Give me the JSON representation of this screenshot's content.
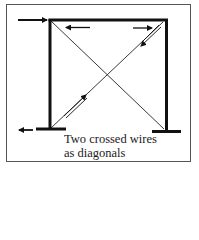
{
  "figure": {
    "caption_line1": "Two crossed wires",
    "caption_line2": "as diagonals",
    "colors": {
      "background": "#ffffff",
      "ink": "#111111",
      "border": "#555555"
    },
    "elements": {
      "frame": "portal frame with two columns and a top beam",
      "bracing": "two crossed diagonal wires",
      "loads": [
        {
          "name": "applied-horizontal-load",
          "direction": "right",
          "location": "top-left"
        },
        {
          "name": "beam-force-arrow",
          "direction": "left",
          "location": "under beam, left"
        },
        {
          "name": "beam-force-arrow",
          "direction": "right",
          "location": "under beam, right"
        },
        {
          "name": "diagonal-force-arrow",
          "direction": "down-left",
          "location": "top-right diagonal"
        },
        {
          "name": "diagonal-force-arrow",
          "direction": "up-right",
          "location": "bottom-left diagonal"
        },
        {
          "name": "reaction-arrow",
          "direction": "left",
          "location": "bottom-left support"
        }
      ]
    }
  }
}
